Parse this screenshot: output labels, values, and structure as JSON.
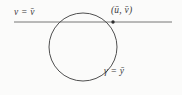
{
  "figure": {
    "type": "geometric-diagram",
    "background_color": "#fbfbfa",
    "stroke_color": "#555555",
    "text_color": "#3a3a3a",
    "labels": {
      "line_left": "v = v̄",
      "intersection_point": "(ū, v̄)",
      "circle_bottom": "γ = ȳ"
    },
    "geometry": {
      "circle": {
        "center_x": 83,
        "center_y": 47,
        "radius": 34
      },
      "horizontal_line": {
        "x_start": 14,
        "x_end": 172,
        "y": 22
      },
      "marked_point": {
        "x": 113,
        "y": 22
      }
    }
  }
}
